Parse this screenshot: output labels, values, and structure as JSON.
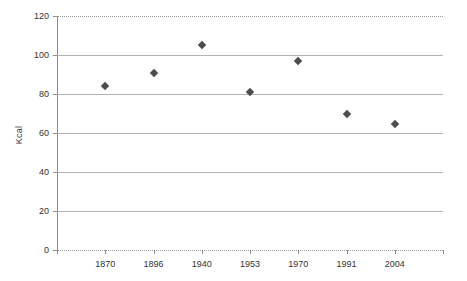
{
  "chart_data": {
    "type": "scatter",
    "title": "",
    "xlabel": "",
    "ylabel": "Kcal",
    "categories": [
      "1870",
      "1896",
      "1940",
      "1953",
      "1970",
      "1991",
      "2004"
    ],
    "values": [
      84,
      91,
      105,
      81,
      97,
      70,
      64.5
    ],
    "series": [
      {
        "name": "Kcal",
        "values": [
          84,
          91,
          105,
          81,
          97,
          70,
          64.5
        ]
      }
    ],
    "ylim": [
      0,
      120
    ],
    "y_ticks": [
      0,
      20,
      40,
      60,
      80,
      100,
      120
    ],
    "y_tick_labels": [
      "0",
      "20",
      "40",
      "60",
      "80",
      "100",
      "120"
    ],
    "grid": true,
    "grid_axis": "y",
    "legend": false,
    "marker": "diamond",
    "marker_color": "#4d4d4d",
    "grid_color": "#b3b3b3",
    "axis_color": "#8c8c8c",
    "background": "#ffffff"
  }
}
